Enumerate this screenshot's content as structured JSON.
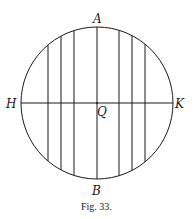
{
  "figure": {
    "caption": "Fig. 33.",
    "labels": {
      "top": "A",
      "bottom": "B",
      "left": "H",
      "right": "K",
      "center": "Q"
    },
    "circle": {
      "cx": 97,
      "cy": 103,
      "r": 76
    },
    "horizontal_diameter": {
      "name": "HK",
      "y": 103
    },
    "vertical_chords_x": [
      48,
      61,
      74,
      97,
      119,
      132,
      145
    ],
    "stroke_color": "#1a1a1a"
  }
}
